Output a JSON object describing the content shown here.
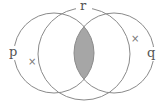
{
  "diagram": {
    "type": "venn",
    "sets": [
      {
        "name": "p",
        "label": "p"
      },
      {
        "name": "q",
        "label": "q"
      },
      {
        "name": "r",
        "label": "r"
      }
    ],
    "shaded_region": "p ∩ q",
    "marks": [
      {
        "symbol": "×",
        "region": "p only"
      },
      {
        "symbol": "×",
        "region": "q only"
      }
    ],
    "colors": {
      "stroke": "#8a8a8a",
      "shade": "#a6a6a6"
    }
  }
}
